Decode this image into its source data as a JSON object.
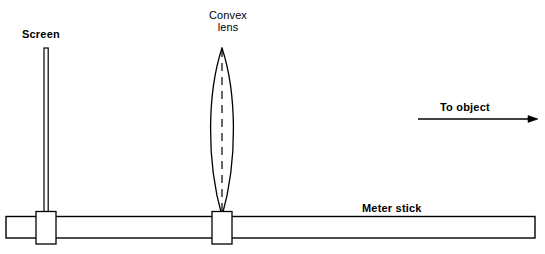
{
  "figure": {
    "kind": "optics-bench-diagram",
    "background_color": "#ffffff",
    "stroke_color": "#000000",
    "width": 545,
    "height": 254
  },
  "labels": {
    "screen": "Screen",
    "convex_lens_line1": "Convex",
    "convex_lens_line2": "lens",
    "to_object": "To object",
    "meter_stick": "Meter stick"
  },
  "components": {
    "screen": {
      "name": "Screen",
      "type": "vertical-flat-post",
      "x": 46,
      "top_y": 48,
      "bottom_y": 216,
      "width": 4
    },
    "convex_lens": {
      "name": "Convex lens",
      "type": "biconvex-lens-profile",
      "center_x": 222,
      "apex_top_y": 48,
      "apex_bottom_y": 216,
      "max_half_width": 16,
      "optical_axis": "dashed-vertical"
    },
    "meter_stick": {
      "name": "Meter stick",
      "type": "horizontal-bar",
      "left_x": 6,
      "right_x": 536,
      "top_y": 216,
      "bottom_y": 238
    },
    "clamps": [
      {
        "name": "screen-clamp",
        "center_x": 46,
        "top_y": 212,
        "bottom_y": 244,
        "width": 20
      },
      {
        "name": "lens-clamp",
        "center_x": 222,
        "top_y": 212,
        "bottom_y": 244,
        "width": 20
      }
    ],
    "direction_arrow": {
      "name": "to-object-arrow",
      "label": "To object",
      "x_start": 418,
      "x_end": 538,
      "y": 119,
      "points": "right"
    }
  }
}
